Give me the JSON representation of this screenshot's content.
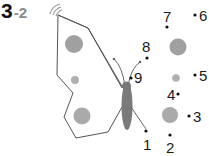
{
  "title": {
    "main": "3",
    "sub": "-2"
  },
  "puzzle": {
    "type": "connect-the-dots",
    "subject": "butterfly",
    "dots": [
      {
        "label": "1"
      },
      {
        "label": "2"
      },
      {
        "label": "3"
      },
      {
        "label": "4"
      },
      {
        "label": "5"
      },
      {
        "label": "6"
      },
      {
        "label": "7"
      },
      {
        "label": "8"
      },
      {
        "label": "9"
      }
    ]
  },
  "colors": {
    "outline": "#555555",
    "spot": "#a8a8a8",
    "body": "#7a7a7a",
    "dot": "#111111",
    "title_sub": "#8a8a8a"
  }
}
